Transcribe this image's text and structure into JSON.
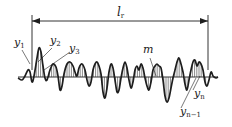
{
  "diagram": {
    "colors": {
      "line": "#1e1e1e",
      "hatch": "#3a3a3a",
      "background": "#ffffff"
    },
    "dimension": {
      "label_main": "l",
      "label_sub": "r",
      "x_start": 32,
      "x_end": 208,
      "y": 21
    },
    "mean_line": {
      "label": "m",
      "y": 77,
      "x_start": 18,
      "x_end": 218
    },
    "labels": [
      {
        "id": "y1",
        "main": "y",
        "sub": "1"
      },
      {
        "id": "y2",
        "main": "y",
        "sub": "2"
      },
      {
        "id": "y3",
        "main": "y",
        "sub": "3"
      },
      {
        "id": "m",
        "main": "m",
        "sub": ""
      },
      {
        "id": "yn",
        "main": "y",
        "sub": "n"
      },
      {
        "id": "yn-1",
        "main": "y",
        "sub": "n−1"
      }
    ]
  }
}
